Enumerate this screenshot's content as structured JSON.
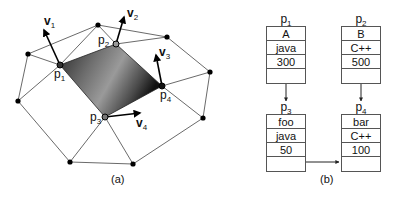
{
  "figure_a": {
    "caption": "(a)",
    "points": [
      {
        "id": "p1",
        "label": "p",
        "sub": "1"
      },
      {
        "id": "p2",
        "label": "p",
        "sub": "2"
      },
      {
        "id": "p3",
        "label": "p",
        "sub": "3"
      },
      {
        "id": "p4",
        "label": "p",
        "sub": "4"
      }
    ],
    "vectors": [
      {
        "id": "v1",
        "label": "v",
        "sub": "1"
      },
      {
        "id": "v2",
        "label": "v",
        "sub": "2"
      },
      {
        "id": "v3",
        "label": "v",
        "sub": "3"
      },
      {
        "id": "v4",
        "label": "v",
        "sub": "4"
      }
    ]
  },
  "figure_b": {
    "caption": "(b)",
    "tables": [
      {
        "id": "p1",
        "label": "p",
        "sub": "1",
        "cells": [
          "A",
          "java",
          "300",
          ""
        ]
      },
      {
        "id": "p2",
        "label": "p",
        "sub": "2",
        "cells": [
          "B",
          "C++",
          "500",
          ""
        ]
      },
      {
        "id": "p3",
        "label": "p",
        "sub": "3",
        "cells": [
          "foo",
          "java",
          "50",
          ""
        ]
      },
      {
        "id": "p4",
        "label": "p",
        "sub": "4",
        "cells": [
          "bar",
          "C++",
          "100",
          ""
        ]
      }
    ],
    "links": [
      {
        "from": "p1",
        "to": "p3"
      },
      {
        "from": "p2",
        "to": "p4"
      },
      {
        "from": "p3",
        "to": "p4"
      }
    ]
  }
}
